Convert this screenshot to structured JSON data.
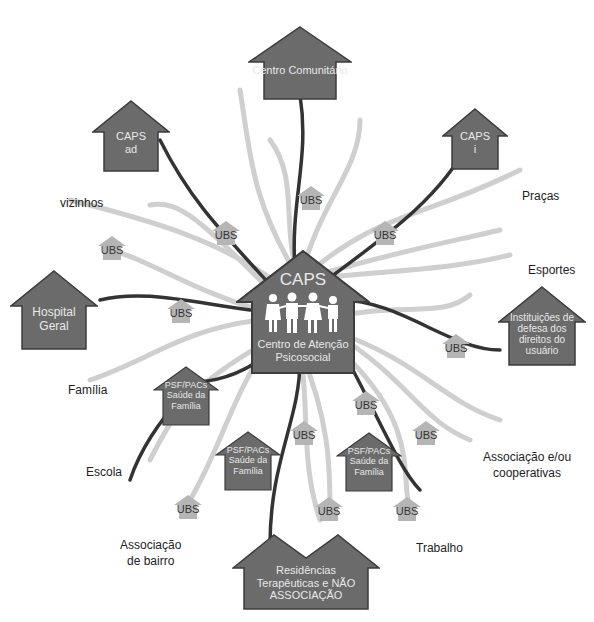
{
  "colors": {
    "house_fill": "#6b6b6b",
    "house_stroke": "#3c3c3c",
    "ubs_fill": "#b5b5b5",
    "dark_line": "#333333",
    "light_line": "#c8c8c8"
  },
  "center": {
    "title": "CAPS",
    "subtitle": "Centro de Atenção Psicosocial",
    "icon": "family-icon"
  },
  "houses": {
    "centro_comunitario": "Centro Comunitário",
    "caps_ad_1": "CAPS",
    "caps_ad_2": "ad",
    "caps_i_1": "CAPS",
    "caps_i_2": "i",
    "hospital_1": "Hospital",
    "hospital_2": "Geral",
    "instituicoes_1": "Instituições de",
    "instituicoes_2": "defesa dos",
    "instituicoes_3": "direitos do",
    "instituicoes_4": "usuário",
    "psf_1": "PSF/PACs",
    "psf_2": "Saúde da",
    "psf_3": "Família",
    "residencias_1": "Residências",
    "residencias_2": "Terapêuticas e NÃO",
    "residencias_3": "ASSOCIAÇÃO"
  },
  "ubs_label": "UBS",
  "labels": {
    "vizinhos": "vizinhos",
    "pracas": "Praças",
    "esportes": "Esportes",
    "familia": "Família",
    "escola": "Escola",
    "associacao_cooperativas_1": "Associação e/ou",
    "associacao_cooperativas_2": "cooperativas",
    "associacao_bairro_1": "Associação",
    "associacao_bairro_2": "de bairro",
    "trabalho": "Trabalho"
  }
}
